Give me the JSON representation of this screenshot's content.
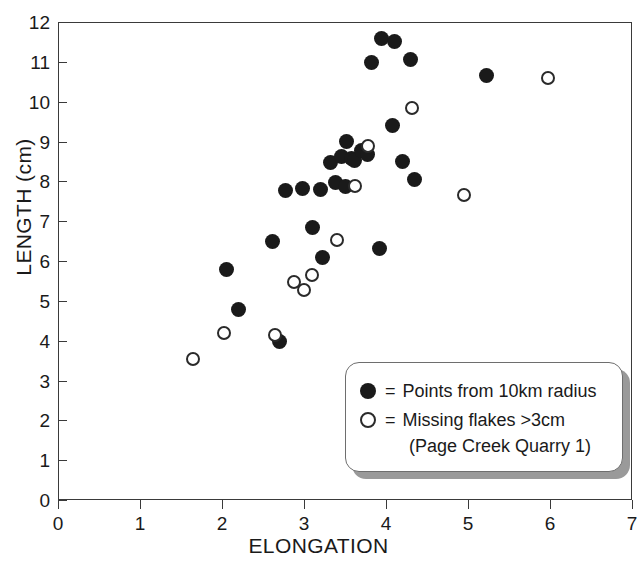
{
  "chart_data": {
    "type": "scatter",
    "title": "",
    "xlabel": "ELONGATION",
    "ylabel": "LENGTH (cm)",
    "xlim": [
      0,
      7
    ],
    "ylim": [
      0,
      12
    ],
    "xticks": [
      0,
      1,
      2,
      3,
      4,
      5,
      6,
      7
    ],
    "yticks": [
      0,
      1,
      2,
      3,
      4,
      5,
      6,
      7,
      8,
      9,
      10,
      11,
      12
    ],
    "xtick_labels": [
      "0",
      "1",
      "2",
      "3",
      "4",
      "5",
      "6",
      "7"
    ],
    "ytick_labels": [
      "0",
      "1",
      "2",
      "3",
      "4",
      "5",
      "6",
      "7",
      "8",
      "9",
      "10",
      "11",
      "12"
    ],
    "grid": false,
    "legend_position": "bottom-right",
    "marker_color": "#1a1a1a",
    "series": [
      {
        "name": "Points from 10km radius",
        "marker": "filled-circle",
        "color": "#1a1a1a",
        "points": [
          [
            2.05,
            5.78
          ],
          [
            2.2,
            4.78
          ],
          [
            2.62,
            6.5
          ],
          [
            2.7,
            3.98
          ],
          [
            2.78,
            7.78
          ],
          [
            2.98,
            7.82
          ],
          [
            3.1,
            6.85
          ],
          [
            3.2,
            7.8
          ],
          [
            3.22,
            6.08
          ],
          [
            3.32,
            8.48
          ],
          [
            3.38,
            7.98
          ],
          [
            3.46,
            8.62
          ],
          [
            3.52,
            9.0
          ],
          [
            3.58,
            8.58
          ],
          [
            3.62,
            8.52
          ],
          [
            3.5,
            7.88
          ],
          [
            3.7,
            8.78
          ],
          [
            3.78,
            8.68
          ],
          [
            3.82,
            10.98
          ],
          [
            3.95,
            11.58
          ],
          [
            4.1,
            11.52
          ],
          [
            3.92,
            6.32
          ],
          [
            4.08,
            9.4
          ],
          [
            4.3,
            11.05
          ],
          [
            4.2,
            8.5
          ],
          [
            4.35,
            8.05
          ],
          [
            5.22,
            10.65
          ]
        ]
      },
      {
        "name": "Missing flakes >3cm (Page Creek Quarry 1)",
        "marker": "open-circle",
        "color": "#2a2a2a",
        "points": [
          [
            1.65,
            3.55
          ],
          [
            2.02,
            4.2
          ],
          [
            2.65,
            4.15
          ],
          [
            2.88,
            5.48
          ],
          [
            3.0,
            5.28
          ],
          [
            3.1,
            5.65
          ],
          [
            3.4,
            6.52
          ],
          [
            3.62,
            7.88
          ],
          [
            3.78,
            8.88
          ],
          [
            4.32,
            9.85
          ],
          [
            4.95,
            7.65
          ],
          [
            5.98,
            10.6
          ]
        ]
      }
    ],
    "legend": {
      "equals": "=",
      "entries": [
        {
          "marker": "filled-circle",
          "label": "Points from 10km radius",
          "sublabel": ""
        },
        {
          "marker": "open-circle",
          "label": "Missing flakes >3cm",
          "sublabel": "(Page Creek Quarry 1)"
        }
      ]
    }
  }
}
